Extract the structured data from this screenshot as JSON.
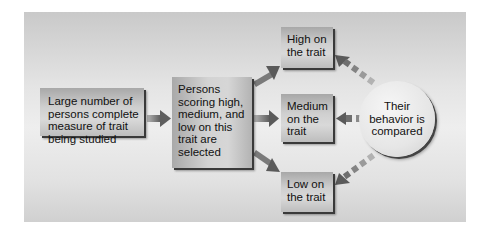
{
  "diagram": {
    "type": "flowchart",
    "nodes": {
      "start": {
        "label": "Large number of\npersons complete\nmeasure of trait\nbeing studied"
      },
      "select": {
        "label": "Persons\nscoring high,\nmedium, and\nlow on this\ntrait are\nselected"
      },
      "high": {
        "label": "High on\nthe trait"
      },
      "medium": {
        "label": "Medium\non the\ntrait"
      },
      "low": {
        "label": "Low on\nthe trait"
      },
      "compare": {
        "label": "Their\nbehavior is\ncompared"
      }
    },
    "edges": [
      {
        "from": "start",
        "to": "select",
        "style": "solid"
      },
      {
        "from": "select",
        "to": "high",
        "style": "solid"
      },
      {
        "from": "select",
        "to": "medium",
        "style": "solid"
      },
      {
        "from": "select",
        "to": "low",
        "style": "solid"
      },
      {
        "from": "compare",
        "to": "high",
        "style": "dashed"
      },
      {
        "from": "compare",
        "to": "medium",
        "style": "dashed"
      },
      {
        "from": "compare",
        "to": "low",
        "style": "dashed"
      }
    ]
  },
  "colors": {
    "frame": "#e0e0e0",
    "box": "#c8c8c8",
    "arrow": "#6a6a6a",
    "text": "#111111"
  }
}
